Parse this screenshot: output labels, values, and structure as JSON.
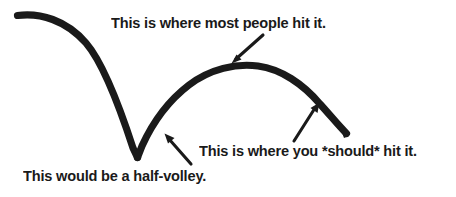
{
  "diagram": {
    "background_color": "#ffffff",
    "ink_color": "#1a1a1a",
    "width": 456,
    "height": 197,
    "captions": [
      {
        "id": "most-people",
        "text": "This is where most people hit it.",
        "x": 111,
        "y": 15
      },
      {
        "id": "should-hit",
        "text": "This is where you *should* hit it.",
        "x": 199,
        "y": 143
      },
      {
        "id": "half-volley",
        "text": "This would be a half-volley.",
        "x": 23,
        "y": 168
      }
    ],
    "arrows": [
      {
        "id": "arrow-to-apex",
        "points_to": "top-of-bounce-arc",
        "direction": "down-left",
        "from_x": 263,
        "from_y": 35,
        "to_x": 232,
        "to_y": 63
      },
      {
        "id": "arrow-to-rising-ball",
        "points_to": "descending-right-side-of-arc",
        "direction": "up-right",
        "from_x": 294,
        "from_y": 141,
        "to_x": 319,
        "to_y": 103
      },
      {
        "id": "arrow-to-bounce-point",
        "points_to": "bounce-vertex",
        "direction": "up-left",
        "from_x": 191,
        "from_y": 164,
        "to_x": 165,
        "to_y": 134
      }
    ],
    "trajectory": {
      "id": "ball-path",
      "description": "Ball descends from upper left, bounces sharply at the vertex, arcs up over a peak and descends again to the right.",
      "start_x": 17,
      "start_y": 14,
      "bounce_x": 137,
      "bounce_y": 157,
      "peak_x": 255,
      "peak_y": 67,
      "end_x": 347,
      "end_y": 134,
      "stroke_width": 7
    }
  }
}
